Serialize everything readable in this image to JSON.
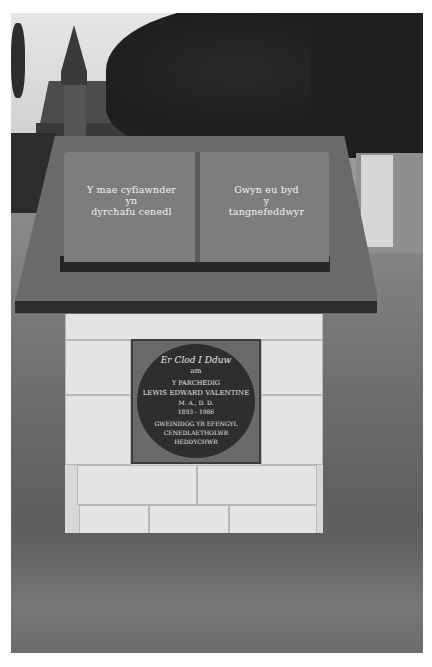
{
  "image": {
    "description": "Black-and-white photograph of a stone memorial plinth with an open book sculpture on a slanted slab, in a churchyard",
    "colors": {
      "background": "#ffffff",
      "slab": "#6a6a6a",
      "book": "#7d7d7d",
      "stone": "#e4e4e4",
      "plaque": "#2e2e2e",
      "text": "#f4f4f4"
    }
  },
  "book": {
    "left_page": [
      "Y mae cyfiawnder",
      "yn",
      "dyrchafu cenedl"
    ],
    "right_page": [
      "Gwyn eu byd",
      "y",
      "tangnefeddwyr"
    ]
  },
  "plaque": {
    "heading": "Er Clod I Dduw",
    "line_am": "am",
    "title": "Y PARCHEDIG",
    "name": "LEWIS EDWARD VALENTINE",
    "degrees": "M. A., D. D.",
    "dates": "1893 - 1986",
    "role_line1": "GWEINIDOG YR EFENGYL",
    "role_line2": "CENEDLAETHOLWR",
    "role_line3": "HEDDYCHWR"
  }
}
